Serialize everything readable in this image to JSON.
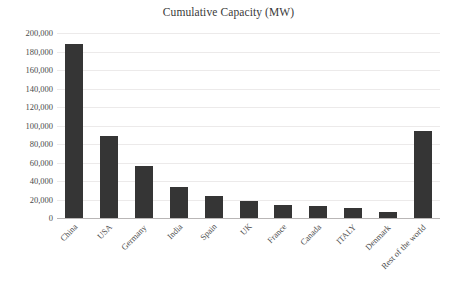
{
  "chart_data": {
    "type": "bar",
    "title": "Cumulative Capacity (MW)",
    "xlabel": "",
    "ylabel": "",
    "ylim": [
      0,
      200000
    ],
    "ytick_step": 20000,
    "grid": true,
    "legend": false,
    "legend_position": "none",
    "bar_color": "#353535",
    "categories": [
      "China",
      "USA",
      "Germany",
      "India",
      "Spain",
      "UK",
      "France",
      "Canada",
      "ITALY",
      "Denmark",
      "Rest of the world"
    ],
    "values": [
      188000,
      89000,
      56500,
      33500,
      23500,
      18500,
      14500,
      13000,
      10500,
      6500,
      94000
    ],
    "ytick_labels": [
      "200,000",
      "180,000",
      "160,000",
      "140,000",
      "120,000",
      "100,000",
      "80,000",
      "60,000",
      "40,000",
      "20,000",
      "0"
    ],
    "ytick_values": [
      200000,
      180000,
      160000,
      140000,
      120000,
      100000,
      80000,
      60000,
      40000,
      20000,
      0
    ]
  }
}
